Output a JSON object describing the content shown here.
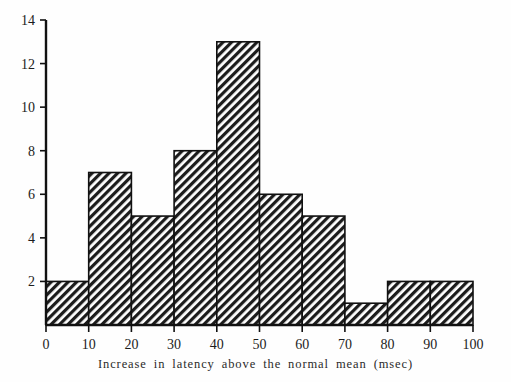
{
  "chart_data": {
    "type": "bar",
    "title": "",
    "subtitle": "",
    "xlabel": "Increase in latency above the normal mean (msec)",
    "ylabel": "",
    "categories": [
      "0-10",
      "10-20",
      "20-30",
      "30-40",
      "40-50",
      "50-60",
      "60-70",
      "70-80",
      "80-90",
      "90-100"
    ],
    "bin_edges": [
      0,
      10,
      20,
      30,
      40,
      50,
      60,
      70,
      80,
      90,
      100
    ],
    "values": [
      2,
      7,
      5,
      8,
      13,
      6,
      5,
      1,
      2,
      2
    ],
    "xlim": [
      0,
      100
    ],
    "ylim": [
      0,
      14
    ],
    "x_ticks": [
      "0",
      "10",
      "20",
      "30",
      "40",
      "50",
      "60",
      "70",
      "80",
      "90",
      "100"
    ],
    "y_ticks": [
      "2",
      "4",
      "6",
      "8",
      "10",
      "12",
      "14"
    ],
    "x_tick_values": [
      0,
      10,
      20,
      30,
      40,
      50,
      60,
      70,
      80,
      90,
      100
    ],
    "y_tick_values": [
      2,
      4,
      6,
      8,
      10,
      12,
      14
    ],
    "grid": false,
    "legend": null,
    "legend_position": "none",
    "bar_fill": "diagonal-hatch",
    "bar_fill_color": "#1c1c1c",
    "bar_edge_color": "#111111",
    "background_color": "#fefefe",
    "axis_color": "#111111"
  },
  "caption": {
    "text": "Increase in latency above the normal mean (msec)"
  }
}
